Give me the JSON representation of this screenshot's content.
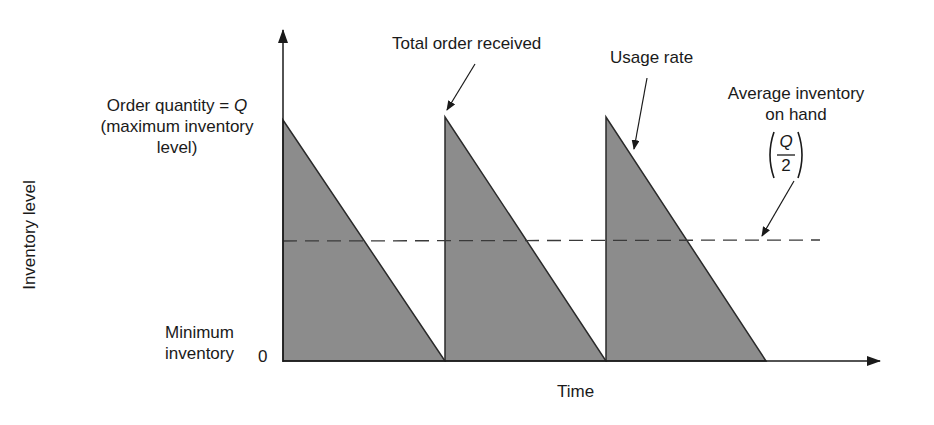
{
  "diagram": {
    "type": "inventory-sawtooth",
    "axes": {
      "y_label": "Inventory level",
      "x_label": "Time",
      "zero_label": "0"
    },
    "labels": {
      "order_quantity": {
        "line1_prefix": "Order quantity = ",
        "line1_var": "Q",
        "line2": "(maximum inventory",
        "line3": "level)"
      },
      "minimum_inventory": {
        "line1": "Minimum",
        "line2": "inventory"
      },
      "total_order_received": "Total order received",
      "usage_rate": "Usage rate",
      "average_inventory": {
        "line1": "Average inventory",
        "line2": "on hand",
        "fraction_numerator": "Q",
        "fraction_denominator": "2"
      }
    },
    "colors": {
      "fill": "#8c8c8c",
      "stroke": "#2a2a2a",
      "dashed": "#3a3a3a",
      "background": "#ffffff"
    }
  }
}
